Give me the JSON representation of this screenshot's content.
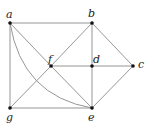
{
  "diagram": {
    "type": "graph",
    "vertices": [
      {
        "id": "a",
        "label": "a",
        "x": 10,
        "y": 23,
        "lx": 6,
        "ly": 9
      },
      {
        "id": "b",
        "label": "b",
        "x": 92,
        "y": 23,
        "lx": 88,
        "ly": 8
      },
      {
        "id": "c",
        "label": "c",
        "x": 133,
        "y": 66,
        "lx": 138,
        "ly": 59
      },
      {
        "id": "d",
        "label": "d",
        "x": 92,
        "y": 66,
        "lx": 93,
        "ly": 54
      },
      {
        "id": "e",
        "label": "e",
        "x": 92,
        "y": 108,
        "lx": 88,
        "ly": 112
      },
      {
        "id": "f",
        "label": "f",
        "x": 51,
        "y": 66,
        "lx": 48,
        "ly": 54
      },
      {
        "id": "g",
        "label": "g",
        "x": 10,
        "y": 108,
        "lx": 6,
        "ly": 112
      }
    ],
    "edges": [
      [
        "a",
        "b"
      ],
      [
        "a",
        "g"
      ],
      [
        "a",
        "f"
      ],
      [
        "f",
        "e"
      ],
      [
        "b",
        "f"
      ],
      [
        "f",
        "g"
      ],
      [
        "b",
        "d"
      ],
      [
        "d",
        "e"
      ],
      [
        "b",
        "c"
      ],
      [
        "f",
        "d"
      ],
      [
        "d",
        "c"
      ],
      [
        "g",
        "e"
      ],
      [
        "c",
        "e"
      ]
    ],
    "curved_edges": [
      {
        "from": "a",
        "to": "e"
      }
    ],
    "colors": {
      "edge": "#8a8a8a",
      "vertex": "#111111",
      "label": "#222222"
    }
  }
}
